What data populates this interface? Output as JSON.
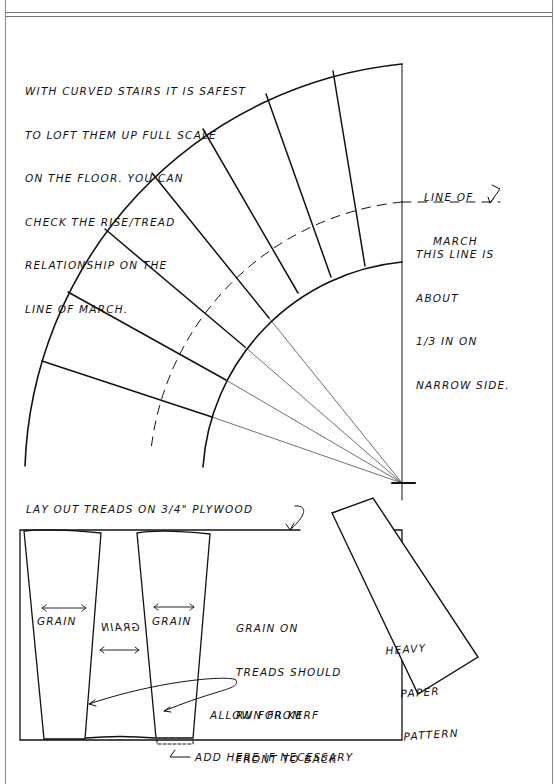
{
  "header": {
    "title_fragment": "SHOP FIG"
  },
  "notes": {
    "curved_stairs": [
      "With curved stairs it is safest",
      "to loft them up full scale",
      "on the floor. You can",
      "check the rise/tread",
      "relationship on the",
      "line of march."
    ],
    "line_of_march_label": [
      "Line of",
      "March"
    ],
    "line_of_march_note": [
      "This line is",
      "about",
      "1/3 in on",
      "narrow side."
    ],
    "layout_treads": "Lay out treads on 3/4\" plywood",
    "grain_direction": [
      "Grain on",
      "treads should",
      "run from",
      "front to back"
    ],
    "pattern_label": [
      "Heavy",
      "paper",
      "pattern"
    ],
    "kerf_note": "Allow for kerf",
    "add_here_note": "Add here if necessary"
  },
  "grain_labels": [
    {
      "text": "GRAIN",
      "mirrored": false
    },
    {
      "text": "GRAIN",
      "mirrored": true
    },
    {
      "text": "GRAIN",
      "mirrored": false
    }
  ],
  "geometry": {
    "center": [
      402,
      483
    ],
    "outer_radius": 419,
    "inner_radius": 221,
    "march_radius": 281,
    "tread_count": 7
  },
  "colors": {
    "ink": "#111111",
    "border": "#888888",
    "background": "#ffffff"
  }
}
